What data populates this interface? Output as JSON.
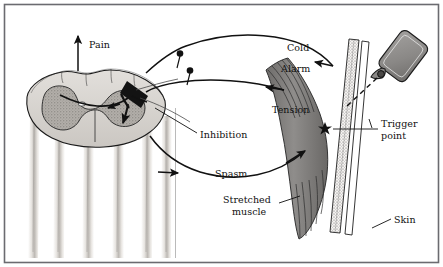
{
  "figure": {
    "border_color": "#6b6b70",
    "background_color": "#ffffff",
    "ink_color": "#111111"
  },
  "labels": {
    "pain": "Pain",
    "cold": "Cold",
    "alarm": "Alarm",
    "tension": "Tension",
    "inhibition": "Inhibition",
    "spasm": "Spasm",
    "trigger_point_line1": "Trigger",
    "trigger_point_line2": "point",
    "stretched_muscle_line1": "Stretched",
    "stretched_muscle_line2": "muscle",
    "skin": "Skin"
  },
  "anatomy": {
    "spinal_cord_name": "spinal-cord-cross-section",
    "white_matter_color": "#d9d6d2",
    "gray_matter_color": "#a8a49f",
    "nerve_root_color": "#cfcbc6",
    "muscle_color": "#8c8a88",
    "muscle_fiber_color": "#3a3a3a",
    "skin_color": "#f2f0ee",
    "spray_bottle_color": "#8f8d8b",
    "spray_bottle_name": "coolant-spray-bottle",
    "trigger_point_marker": "star-marker"
  },
  "arrows": {
    "pain_direction": "up",
    "cold_direction": "skin-to-cord",
    "tension_direction": "muscle-to-cord",
    "spasm_direction": "cord-to-muscle",
    "spray_direction": "bottle-to-trigger-point"
  }
}
